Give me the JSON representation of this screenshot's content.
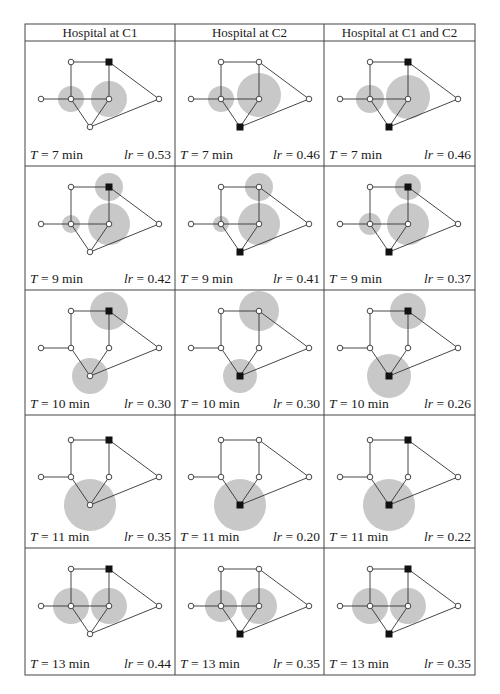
{
  "table": {
    "columns": [
      "Hospital at C1",
      "Hospital at C2",
      "Hospital at C1 and C2"
    ],
    "rows": [
      {
        "T": "7",
        "cells": [
          {
            "lr": "0.53"
          },
          {
            "lr": "0.46"
          },
          {
            "lr": "0.46"
          }
        ]
      },
      {
        "T": "9",
        "cells": [
          {
            "lr": "0.42"
          },
          {
            "lr": "0.41"
          },
          {
            "lr": "0.37"
          }
        ]
      },
      {
        "T": "10",
        "cells": [
          {
            "lr": "0.30"
          },
          {
            "lr": "0.30"
          },
          {
            "lr": "0.26"
          }
        ]
      },
      {
        "T": "11",
        "cells": [
          {
            "lr": "0.35"
          },
          {
            "lr": "0.20"
          },
          {
            "lr": "0.22"
          }
        ]
      },
      {
        "T": "13",
        "cells": [
          {
            "lr": "0.44"
          },
          {
            "lr": "0.35"
          },
          {
            "lr": "0.35"
          }
        ]
      }
    ],
    "caption_format": {
      "T_label": "T",
      "equals": " = ",
      "unit": " min",
      "lr_label": "lr"
    }
  },
  "graph": {
    "nodes": {
      "TL": [
        46,
        21
      ],
      "TR": [
        84,
        21
      ],
      "L": [
        16,
        58
      ],
      "ML": [
        46,
        58
      ],
      "MR": [
        84,
        58
      ],
      "R": [
        134,
        58
      ],
      "B": [
        65,
        86
      ]
    },
    "edges": [
      [
        "TL",
        "TR"
      ],
      [
        "TL",
        "ML"
      ],
      [
        "TR",
        "MR"
      ],
      [
        "TR",
        "R"
      ],
      [
        "L",
        "ML"
      ],
      [
        "ML",
        "MR"
      ],
      [
        "ML",
        "B"
      ],
      [
        "MR",
        "B"
      ],
      [
        "B",
        "R"
      ]
    ],
    "hospital_nodes": {
      "C1": "TR",
      "C2": "B"
    },
    "colors": {
      "coverage": "#c8c8c8",
      "edge": "#333333",
      "node_fill": "#ffffff",
      "hospital": "#111111",
      "border": "#444444"
    }
  },
  "cells": [
    [
      {
        "hospitals": [
          "TR"
        ],
        "circles": [
          [
            46,
            58,
            13
          ],
          [
            84,
            58,
            18
          ]
        ]
      },
      {
        "hospitals": [
          "B"
        ],
        "circles": [
          [
            46,
            58,
            13
          ],
          [
            84,
            54,
            22
          ]
        ]
      },
      {
        "hospitals": [
          "TR",
          "B"
        ],
        "circles": [
          [
            46,
            58,
            14
          ],
          [
            84,
            56,
            22
          ]
        ]
      }
    ],
    [
      {
        "hospitals": [
          "TR"
        ],
        "circles": [
          [
            84,
            21,
            14
          ],
          [
            46,
            58,
            9
          ],
          [
            84,
            58,
            21
          ]
        ]
      },
      {
        "hospitals": [
          "B"
        ],
        "circles": [
          [
            84,
            21,
            14
          ],
          [
            46,
            58,
            8
          ],
          [
            84,
            58,
            21
          ]
        ]
      },
      {
        "hospitals": [
          "TR",
          "B"
        ],
        "circles": [
          [
            84,
            21,
            13
          ],
          [
            46,
            58,
            11
          ],
          [
            84,
            58,
            21
          ]
        ]
      }
    ],
    [
      {
        "hospitals": [
          "TR"
        ],
        "circles": [
          [
            84,
            21,
            19
          ],
          [
            65,
            86,
            18
          ]
        ],
        "no_edges": [
          "ML-MR"
        ]
      },
      {
        "hospitals": [
          "B"
        ],
        "circles": [
          [
            84,
            21,
            20
          ],
          [
            65,
            86,
            17
          ]
        ],
        "no_edges": [
          "ML-MR"
        ]
      },
      {
        "hospitals": [
          "TR",
          "B"
        ],
        "circles": [
          [
            84,
            21,
            18
          ],
          [
            65,
            86,
            22
          ]
        ],
        "no_edges": [
          "ML-MR"
        ]
      }
    ],
    [
      {
        "hospitals": [
          "TR"
        ],
        "circles": [
          [
            65,
            86,
            26
          ]
        ],
        "no_edges": [
          "ML-MR"
        ]
      },
      {
        "hospitals": [
          "B"
        ],
        "circles": [
          [
            65,
            86,
            26
          ]
        ],
        "no_edges": [
          "ML-MR"
        ]
      },
      {
        "hospitals": [
          "TR",
          "B"
        ],
        "circles": [
          [
            65,
            86,
            26
          ]
        ],
        "no_edges": [
          "ML-MR"
        ]
      }
    ],
    [
      {
        "hospitals": [
          "TR"
        ],
        "circles": [
          [
            46,
            58,
            18
          ],
          [
            84,
            58,
            18
          ]
        ]
      },
      {
        "hospitals": [
          "B"
        ],
        "circles": [
          [
            46,
            58,
            16
          ],
          [
            84,
            58,
            18
          ]
        ]
      },
      {
        "hospitals": [
          "TR",
          "B"
        ],
        "circles": [
          [
            46,
            58,
            18
          ],
          [
            84,
            58,
            18
          ]
        ]
      }
    ]
  ]
}
